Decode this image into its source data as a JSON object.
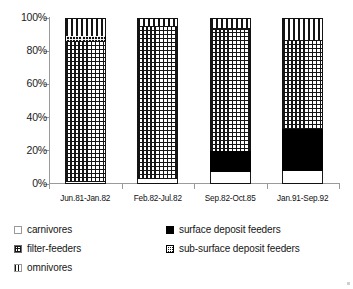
{
  "chart_data": {
    "type": "bar",
    "subtype": "stacked-percentage",
    "title": "",
    "subtitle": "",
    "xlabel": "",
    "ylabel": "",
    "ylim": [
      0,
      100
    ],
    "y_unit": "%",
    "grid": false,
    "legend_position": "bottom",
    "y_ticks": [
      "0%",
      "20%",
      "40%",
      "60%",
      "80%",
      "100%"
    ],
    "y_tick_values": [
      0,
      20,
      40,
      60,
      80,
      100
    ],
    "categories": [
      "Jun.81-Jan.82",
      "Feb.82-Jul.82",
      "Sep.82-Oct.85",
      "Jan.91-Sep.92"
    ],
    "series": [
      {
        "name": "carnivores",
        "pattern": "white",
        "values": [
          1,
          3,
          7,
          8
        ]
      },
      {
        "name": "surface deposit feeders",
        "pattern": "solid-black",
        "values": [
          0,
          0,
          13,
          25
        ]
      },
      {
        "name": "filter-feeders",
        "pattern": "grid-crosshatch",
        "values": [
          85,
          92,
          74,
          54
        ]
      },
      {
        "name": "sub-surface deposit feeders",
        "pattern": "dark-grid",
        "values": [
          3,
          0,
          0,
          0
        ]
      },
      {
        "name": "omnivores",
        "pattern": "vertical-stripes",
        "values": [
          11,
          5,
          6,
          13
        ]
      }
    ]
  },
  "axis": {
    "y_labels": [
      "100%",
      "80%",
      "60%",
      "40%",
      "20%",
      "0%"
    ],
    "x_labels": [
      "Jun.81-Jan.82",
      "Feb.82-Jul.82",
      "Sep.82-Oct.85",
      "Jan.91-Sep.92"
    ]
  },
  "legend": {
    "items": [
      {
        "label": "carnivores",
        "swatch": "white-swatch"
      },
      {
        "label": "surface deposit feeders",
        "swatch": "black-swatch"
      },
      {
        "label": "filter-feeders",
        "swatch": "grid-swatch"
      },
      {
        "label": "sub-surface deposit feeders",
        "swatch": "dark-grid-swatch"
      },
      {
        "label": "omnivores",
        "swatch": "stripe-swatch"
      }
    ]
  },
  "colors": {
    "ink": "#141414",
    "axis": "#9a9a9a",
    "background": "#ffffff"
  }
}
